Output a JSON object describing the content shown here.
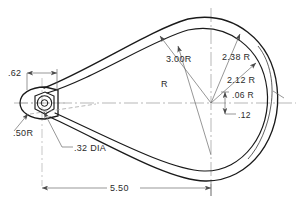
{
  "drawing": {
    "title": "Rope thimble profile — dimensioned engineering drawing",
    "type": "2d-orthographic-detail",
    "units": "inches",
    "line_color": "#1a1a1a",
    "thin_line_color": "#555555",
    "center_line_color": "#8a8a8a",
    "text_color": "#2b2b2b",
    "background": "#ffffff"
  },
  "labels": {
    "r_3_00": "3.00R",
    "r_plain": "R",
    "r_2_38": "2.38 R",
    "r_2_12": "2.12 R",
    "r_06": ".06 R",
    "d_12": ".12",
    "d_62": ".62",
    "r_50": ".50R",
    "dia_32": ".32 DIA",
    "d_5_50": "5.50"
  },
  "dimensions": [
    {
      "name": "radius-3-00",
      "text": "3.00R",
      "kind": "radius",
      "value": 3.0
    },
    {
      "name": "radius-unlabeled",
      "text": "R",
      "kind": "radius",
      "value": null
    },
    {
      "name": "radius-2-38",
      "text": "2.38 R",
      "kind": "radius",
      "value": 2.38
    },
    {
      "name": "radius-2-12",
      "text": "2.12 R",
      "kind": "radius",
      "value": 2.12
    },
    {
      "name": "radius-06",
      "text": ".06 R",
      "kind": "radius",
      "value": 0.06
    },
    {
      "name": "offset-12",
      "text": ".12",
      "kind": "linear",
      "value": 0.12
    },
    {
      "name": "width-62",
      "text": ".62",
      "kind": "linear",
      "value": 0.62
    },
    {
      "name": "radius-50",
      "text": ".50R",
      "kind": "radius",
      "value": 0.5
    },
    {
      "name": "hole-diameter-32",
      "text": ".32 DIA",
      "kind": "diameter",
      "value": 0.32
    },
    {
      "name": "overall-length-5-50",
      "text": "5.50",
      "kind": "linear",
      "value": 5.5
    }
  ]
}
